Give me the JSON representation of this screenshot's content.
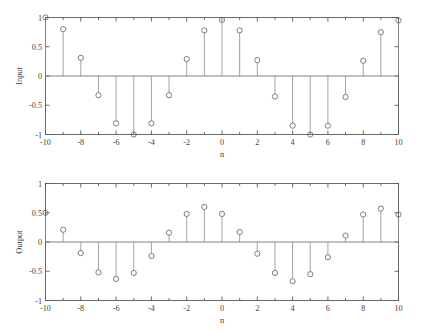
{
  "figure": {
    "background_color": "#ffffff",
    "axis_color": "#595959",
    "stem_color": "#8a8a8a",
    "marker_color": "#6e6e6e",
    "width": 422,
    "height": 332
  },
  "chart_data": [
    {
      "type": "scatter",
      "subtype": "stem",
      "panel": "top",
      "title": "",
      "xlabel": "n",
      "ylabel": "Input",
      "xlim": [
        -10,
        10
      ],
      "ylim": [
        -1,
        1
      ],
      "grid": false,
      "legend": "none",
      "xticks": [
        -10,
        -8,
        -6,
        -4,
        -2,
        0,
        2,
        4,
        6,
        8,
        10
      ],
      "xticklabels": [
        "-10",
        "-8",
        "-6",
        "-4",
        "-2",
        "0",
        "2",
        "4",
        "6",
        "8",
        "10"
      ],
      "xminorticks": [
        -9,
        -7,
        -5,
        -3,
        -1,
        1,
        3,
        5,
        7,
        9
      ],
      "yticks": [
        -1,
        -0.5,
        0,
        0.5,
        1
      ],
      "yticklabels": [
        "-1",
        "-0.5",
        "0",
        "0.5",
        "1"
      ],
      "x": [
        -10,
        -9,
        -8,
        -7,
        -6,
        -5,
        -4,
        -3,
        -2,
        -1,
        0,
        1,
        2,
        3,
        4,
        5,
        6,
        7,
        8,
        9,
        10
      ],
      "values": [
        1.0,
        0.8,
        0.31,
        -0.33,
        -0.81,
        -1.0,
        -0.81,
        -0.33,
        0.29,
        0.78,
        0.96,
        0.78,
        0.27,
        -0.35,
        -0.85,
        -1.0,
        -0.85,
        -0.36,
        0.26,
        0.75,
        0.95
      ]
    },
    {
      "type": "scatter",
      "subtype": "stem",
      "panel": "bottom",
      "title": "",
      "xlabel": "n",
      "ylabel": "Output",
      "xlim": [
        -10,
        10
      ],
      "ylim": [
        -1,
        1
      ],
      "grid": false,
      "legend": "none",
      "xticks": [
        -10,
        -8,
        -6,
        -4,
        -2,
        0,
        2,
        4,
        6,
        8,
        10
      ],
      "xticklabels": [
        "-10",
        "-8",
        "-6",
        "-4",
        "-2",
        "0",
        "2",
        "4",
        "6",
        "8",
        "10"
      ],
      "xminorticks": [
        -9,
        -7,
        -5,
        -3,
        -1,
        1,
        3,
        5,
        7,
        9
      ],
      "yticks": [
        -1,
        -0.5,
        0,
        0.5,
        1
      ],
      "yticklabels": [
        "-1",
        "-0.5",
        "0",
        "0.5",
        "1"
      ],
      "x": [
        -10,
        -9,
        -8,
        -7,
        -6,
        -5,
        -4,
        -3,
        -2,
        -1,
        0,
        1,
        2,
        3,
        4,
        5,
        6,
        7,
        8,
        9,
        10
      ],
      "values": [
        0.5,
        0.21,
        -0.19,
        -0.52,
        -0.63,
        -0.53,
        -0.24,
        0.16,
        0.48,
        0.6,
        0.48,
        0.17,
        -0.2,
        -0.53,
        -0.67,
        -0.55,
        -0.26,
        0.11,
        0.47,
        0.57,
        0.47
      ]
    }
  ]
}
